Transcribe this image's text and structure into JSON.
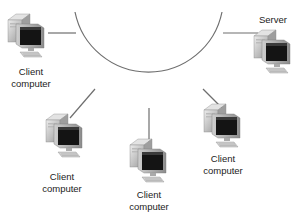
{
  "diagram": {
    "type": "network-topology",
    "topology": "ring/bus arc",
    "nodes": [
      {
        "id": "client-top-left",
        "kind": "client",
        "label_line1": "Client",
        "label_line2": "computer"
      },
      {
        "id": "server",
        "kind": "server",
        "label_line1": "Server",
        "label_line2": ""
      },
      {
        "id": "client-lower-left",
        "kind": "client",
        "label_line1": "Client",
        "label_line2": "computer"
      },
      {
        "id": "client-bottom",
        "kind": "client",
        "label_line1": "Client",
        "label_line2": "computer"
      },
      {
        "id": "client-lower-right",
        "kind": "client",
        "label_line1": "Client",
        "label_line2": "computer"
      }
    ],
    "icon": "desktop-computer-icon",
    "colors": {
      "line": "#6e6e6e",
      "case_light": "#d8d8d8",
      "case_mid": "#a9a9a9",
      "case_dark": "#7a7a7a",
      "screen": "#141414",
      "text": "#222222"
    }
  }
}
